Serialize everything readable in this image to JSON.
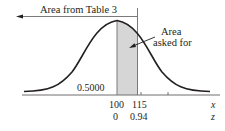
{
  "figure": {
    "type": "normal-distribution-diagram",
    "labels": {
      "area_from_table": "Area from Table 3",
      "area_asked_line1": "Area",
      "area_asked_line2": "asked for",
      "half_area": "0.5000"
    },
    "axis": {
      "x_label": "x",
      "z_label": "z",
      "x_ticks": [
        "100",
        "115"
      ],
      "z_ticks": [
        "0",
        "0.94"
      ]
    },
    "colors": {
      "curve": "#231f20",
      "shade": "#d9d9d9",
      "line": "#808080"
    }
  }
}
